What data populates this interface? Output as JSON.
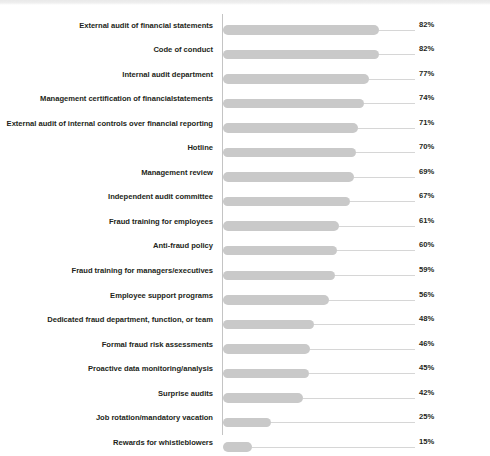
{
  "chart_data": {
    "type": "bar",
    "orientation": "horizontal",
    "title": "",
    "xlabel": "",
    "ylabel": "",
    "xlim": [
      0,
      100
    ],
    "grid": false,
    "leader_lines": true,
    "value_suffix": "%",
    "bar_color": "#c9c9c9",
    "label_color": "#231f20",
    "axis_color": "#c4c4c4",
    "leader_color": "#d6d6d6",
    "categories": [
      "External audit of financial statements",
      "Code of conduct",
      "Internal audit department",
      "Management certification of financialstatements",
      "External audit of internal controls over financial reporting",
      "Hotline",
      "Management review",
      "Independent audit committee",
      "Fraud training for employees",
      "Anti-fraud policy",
      "Fraud training for managers/executives",
      "Employee support programs",
      "Dedicated fraud department, function, or team",
      "Formal fraud risk assessments",
      "Proactive data monitoring/analysis",
      "Surprise audits",
      "Job rotation/mandatory vacation",
      "Rewards for whistleblowers"
    ],
    "values": [
      82,
      82,
      77,
      74,
      71,
      70,
      69,
      67,
      61,
      60,
      59,
      56,
      48,
      46,
      45,
      42,
      25,
      15
    ],
    "value_labels": [
      "82%",
      "82%",
      "77%",
      "74%",
      "71%",
      "70%",
      "69%",
      "67%",
      "61%",
      "60%",
      "59%",
      "56%",
      "48%",
      "46%",
      "45%",
      "42%",
      "25%",
      "15%"
    ]
  }
}
